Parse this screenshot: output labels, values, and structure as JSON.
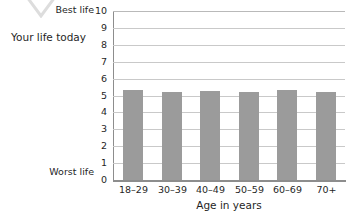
{
  "axis_caption": "Your life today",
  "anchors": {
    "best": "Best life",
    "worst": "Worst life"
  },
  "colors": {
    "bar": "#9b9b9b",
    "gridline": "#c9c9c9",
    "axis": "#8d8d8d",
    "text": "#1f1f1f"
  },
  "icons": {
    "watermark": "chevron-down-icon"
  },
  "chart_data": {
    "type": "bar",
    "title": "",
    "subtitle": "",
    "xlabel": "Age in years",
    "ylabel": "Your life today",
    "categories": [
      "18–29",
      "30–39",
      "40–49",
      "50–59",
      "60–69",
      "70+"
    ],
    "values": [
      5.3,
      5.2,
      5.25,
      5.2,
      5.35,
      5.2
    ],
    "ylim": [
      0,
      10
    ],
    "yticks": [
      0,
      1,
      2,
      3,
      4,
      5,
      6,
      7,
      8,
      9,
      10
    ],
    "ytick_labels": [
      "0",
      "1",
      "2",
      "3",
      "4",
      "5",
      "6",
      "7",
      "8",
      "9",
      "10"
    ],
    "y_axis_anchors": {
      "0": "Worst life",
      "10": "Best life"
    },
    "grid": true,
    "grid_axis": "y",
    "legend": false,
    "legend_position": "none",
    "series": [
      {
        "name": "Your life today",
        "values": [
          5.3,
          5.2,
          5.25,
          5.2,
          5.35,
          5.2
        ]
      }
    ]
  }
}
